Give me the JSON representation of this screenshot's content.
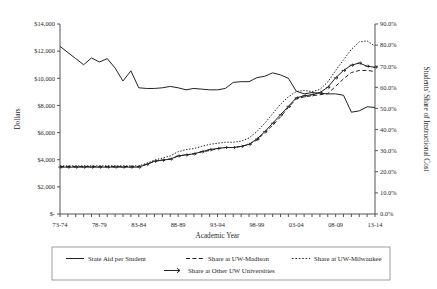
{
  "chart_data": {
    "type": "line",
    "title": "",
    "xlabel": "Academic Year",
    "ylabel": "Dollars",
    "y2label": "Students' Share of Instructional Cost",
    "grid": false,
    "legend_position": "bottom",
    "ylim": [
      0,
      14000
    ],
    "y2lim": [
      0,
      0.9
    ],
    "ytick_labels": [
      "$-",
      "$2,000",
      "$4,000",
      "$6,000",
      "$8,000",
      "$10,000",
      "$12,000",
      "$14,000"
    ],
    "ytick_values": [
      0,
      2000,
      4000,
      6000,
      8000,
      10000,
      12000,
      14000
    ],
    "y2tick_labels": [
      "0.0%",
      "10.0%",
      "20.0%",
      "30.0%",
      "40.0%",
      "50.0%",
      "60.0%",
      "70.0%",
      "80.0%",
      "90.0%"
    ],
    "y2tick_values": [
      0,
      10,
      20,
      30,
      40,
      50,
      60,
      70,
      80,
      90
    ],
    "x": [
      "73-74",
      "74-75",
      "75-76",
      "76-77",
      "77-78",
      "78-79",
      "79-80",
      "80-81",
      "81-82",
      "82-83",
      "83-84",
      "84-85",
      "85-86",
      "86-87",
      "87-88",
      "88-89",
      "89-90",
      "90-91",
      "91-92",
      "92-93",
      "93-94",
      "94-95",
      "95-96",
      "96-97",
      "97-98",
      "98-99",
      "99-00",
      "00-01",
      "01-02",
      "02-03",
      "03-04",
      "04-05",
      "05-06",
      "06-07",
      "07-08",
      "08-09",
      "09-10",
      "10-11",
      "11-12",
      "12-13",
      "13-14"
    ],
    "xtick_labels": [
      "73-74",
      "78-79",
      "83-84",
      "88-89",
      "93-94",
      "98-99",
      "03-04",
      "08-09",
      "13-14"
    ],
    "xtick_indices": [
      0,
      5,
      10,
      15,
      20,
      25,
      30,
      35,
      40
    ],
    "series": [
      {
        "name": "State Aid per Student",
        "axis": "left",
        "style": "solid",
        "marker": "none",
        "values": [
          12350,
          11900,
          11450,
          11000,
          11500,
          11200,
          11450,
          10750,
          9800,
          10550,
          9300,
          9250,
          9250,
          9300,
          9400,
          9300,
          9150,
          9250,
          9200,
          9150,
          9150,
          9250,
          9700,
          9750,
          9750,
          10050,
          10150,
          10400,
          10250,
          10000,
          9050,
          8850,
          8950,
          8900,
          8850,
          8850,
          8750,
          7500,
          7600,
          7900,
          7850
        ]
      },
      {
        "name": "Share at UW-Madison",
        "axis": "right",
        "style": "dashed",
        "marker": "none",
        "values": [
          22.5,
          22.5,
          22.5,
          22.5,
          22.5,
          22.5,
          22.5,
          22.5,
          22.5,
          22.5,
          22.5,
          23.5,
          25.0,
          25.5,
          26.0,
          27.5,
          28.0,
          28.5,
          29.5,
          30.0,
          31.0,
          31.5,
          31.5,
          32.0,
          33.0,
          35.0,
          38.5,
          42.0,
          46.0,
          50.5,
          54.5,
          55.5,
          56.0,
          56.5,
          57.0,
          60.5,
          64.0,
          67.0,
          68.0,
          68.0,
          67.5
        ]
      },
      {
        "name": "Share at UW-Milwaukee",
        "axis": "right",
        "style": "dotted",
        "marker": "none",
        "values": [
          22.8,
          22.8,
          22.8,
          22.8,
          22.8,
          22.8,
          22.8,
          22.8,
          22.8,
          22.8,
          22.8,
          24.0,
          25.5,
          26.5,
          27.5,
          29.5,
          30.5,
          31.0,
          32.0,
          33.0,
          33.5,
          34.0,
          34.0,
          34.5,
          36.0,
          39.0,
          43.0,
          47.5,
          52.0,
          55.5,
          58.0,
          58.5,
          58.0,
          59.0,
          62.5,
          68.0,
          73.0,
          78.0,
          81.5,
          82.0,
          79.5
        ]
      },
      {
        "name": "Share at Other UW Universities",
        "axis": "right",
        "style": "solid",
        "marker": "arrow",
        "values": [
          22.2,
          22.2,
          22.2,
          22.2,
          22.2,
          22.2,
          22.2,
          22.2,
          22.2,
          22.2,
          22.2,
          23.5,
          25.0,
          25.5,
          26.0,
          27.5,
          28.0,
          28.5,
          29.5,
          30.5,
          31.0,
          31.5,
          31.5,
          32.0,
          33.0,
          35.5,
          39.0,
          43.0,
          47.0,
          51.0,
          55.0,
          56.0,
          56.5,
          57.5,
          60.0,
          64.5,
          68.0,
          70.5,
          71.5,
          70.0,
          69.5
        ]
      }
    ]
  },
  "legend": {
    "items": [
      {
        "label": "State Aid per Student",
        "style": "solid"
      },
      {
        "label": "Share at UW-Madison",
        "style": "dashed"
      },
      {
        "label": "Share at UW-Milwaukee",
        "style": "dotted"
      },
      {
        "label": "Share at Other UW Universities",
        "style": "arrow"
      }
    ]
  },
  "colors": {
    "line": "#222222",
    "axis": "#555555",
    "background": "#ffffff"
  }
}
